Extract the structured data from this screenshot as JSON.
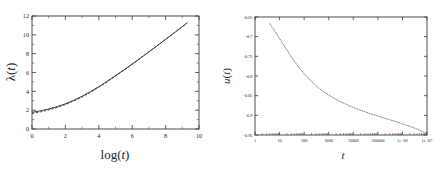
{
  "figure": {
    "title": "",
    "background": "#ffffff",
    "panel_count": 2
  },
  "chart_data": [
    {
      "id": "left-panel",
      "type": "line",
      "title": "",
      "xlabel": "log(t)",
      "ylabel": "λ(t)",
      "xlim": [
        0,
        10
      ],
      "ylim": [
        0,
        12
      ],
      "xticks": [
        0,
        2,
        4,
        6,
        8,
        10
      ],
      "xticklabels": [
        "0",
        "2",
        "4",
        "6",
        "8",
        "10"
      ],
      "yticks": [
        0,
        2,
        4,
        6,
        8,
        10,
        12
      ],
      "yticklabels": [
        "0",
        "2",
        "4",
        "6",
        "8",
        "10",
        "12"
      ],
      "xminorticks": [
        1,
        3,
        5,
        7,
        9
      ],
      "yminorticks": [
        1,
        3,
        5,
        7,
        9,
        11
      ],
      "grid": false,
      "legend": null,
      "series": [
        {
          "name": "solid",
          "style": "solid",
          "color": "#2b2b2b",
          "x": [
            0.0,
            0.5,
            1.0,
            1.5,
            2.0,
            2.5,
            3.0,
            3.5,
            4.0,
            4.5,
            5.0,
            5.5,
            6.0,
            6.5,
            7.0,
            7.5,
            8.0,
            8.5,
            9.0,
            9.3
          ],
          "y": [
            1.78,
            1.93,
            2.12,
            2.37,
            2.68,
            3.05,
            3.48,
            3.97,
            4.5,
            5.07,
            5.66,
            6.27,
            6.9,
            7.54,
            8.19,
            8.85,
            9.52,
            10.19,
            10.87,
            11.28
          ]
        },
        {
          "name": "dashed",
          "style": "dashed",
          "color": "#2b2b2b",
          "x": [
            0.0,
            0.5,
            1.0,
            1.5,
            2.0,
            2.5,
            3.0,
            3.5,
            4.0,
            4.5,
            5.0,
            5.5,
            6.0,
            6.5,
            7.0,
            7.5,
            8.0,
            8.5,
            9.0,
            9.3
          ],
          "y": [
            1.66,
            1.82,
            2.02,
            2.28,
            2.6,
            2.97,
            3.4,
            3.89,
            4.43,
            5.01,
            5.62,
            6.24,
            6.88,
            7.53,
            8.19,
            8.85,
            9.52,
            10.19,
            10.87,
            11.28
          ]
        }
      ]
    },
    {
      "id": "right-panel",
      "type": "line",
      "title": "",
      "xlabel": "t",
      "ylabel": "u(t)",
      "xscale": "log",
      "xlim": [
        1,
        10000000
      ],
      "ylim": [
        -0.95,
        -0.65
      ],
      "xticks": [
        1,
        10,
        100,
        1000,
        10000,
        100000,
        1000000,
        10000000
      ],
      "xticklabels": [
        "1",
        "10",
        "100",
        "1000",
        "10000",
        "100000",
        "1e+06",
        "1e+07"
      ],
      "yticks": [
        -0.65,
        -0.7,
        -0.75,
        -0.8,
        -0.85,
        -0.9,
        -0.95
      ],
      "yticklabels": [
        "-0.65",
        "-0.7",
        "-0.75",
        "-0.8",
        "-0.85",
        "-0.9",
        "-0.95"
      ],
      "grid": false,
      "legend": null,
      "series": [
        {
          "name": "u(t)",
          "style": "dotted",
          "color": "#6d6d6d",
          "x": [
            4,
            6,
            9,
            13,
            20,
            30,
            45,
            70,
            110,
            170,
            260,
            400,
            620,
            1000,
            1600,
            2500,
            4000,
            6500,
            11000,
            18000,
            30000,
            50000,
            90000,
            160000,
            300000,
            600000,
            1200000,
            2500000,
            5000000,
            10000000
          ],
          "y": [
            -0.667,
            -0.683,
            -0.7,
            -0.716,
            -0.734,
            -0.751,
            -0.767,
            -0.783,
            -0.797,
            -0.81,
            -0.821,
            -0.831,
            -0.84,
            -0.848,
            -0.856,
            -0.863,
            -0.869,
            -0.875,
            -0.881,
            -0.886,
            -0.891,
            -0.896,
            -0.901,
            -0.906,
            -0.911,
            -0.917,
            -0.923,
            -0.93,
            -0.938,
            -0.946
          ]
        }
      ]
    }
  ]
}
